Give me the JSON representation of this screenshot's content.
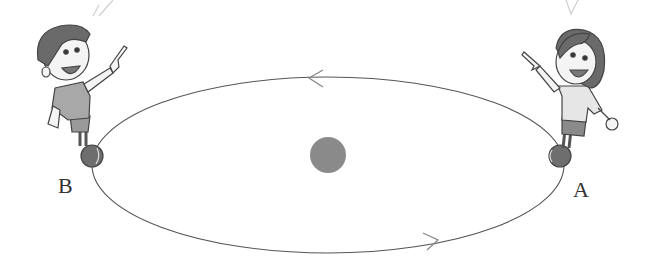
{
  "diagram": {
    "type": "orbit-illustration",
    "orbit": {
      "shape": "ellipse",
      "cx": 328,
      "cy": 165,
      "rx": 236,
      "ry": 88,
      "stroke": "#555555",
      "direction": "counterclockwise"
    },
    "central_body": {
      "name": "sun",
      "cx": 328,
      "cy": 155,
      "r": 18,
      "color": "#8a8a8a"
    },
    "arrows": [
      {
        "position": "top",
        "x": 308,
        "y": 78,
        "points": "left"
      },
      {
        "position": "bottom",
        "x": 432,
        "y": 242,
        "points": "right"
      }
    ],
    "points": [
      {
        "label": "A",
        "x": 552,
        "y": 158,
        "label_x": 573,
        "label_y": 177
      },
      {
        "label": "B",
        "x": 92,
        "y": 157,
        "label_x": 58,
        "label_y": 172
      }
    ],
    "characters": [
      {
        "name": "boy",
        "position": "B",
        "pointing": "up-right",
        "shirt_color": "#9a9a9a"
      },
      {
        "name": "girl",
        "position": "A",
        "pointing": "up-left",
        "hair_color": "#6a6a6a"
      }
    ],
    "colors": {
      "line": "#555555",
      "sun": "#8a8a8a",
      "skin": "#f4f4f4",
      "outline": "#444444"
    }
  }
}
